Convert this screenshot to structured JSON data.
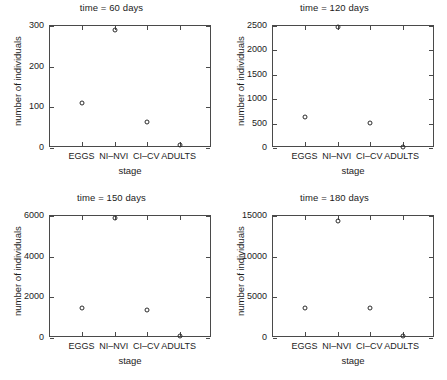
{
  "figure": {
    "background": "#ffffff",
    "marker_color": "#2b2b2b",
    "axis_color": "#4a4a4a",
    "stage_categories": [
      "EGGS",
      "NI–NVI",
      "CI–CV",
      "ADULTS"
    ],
    "xlabel": "stage",
    "ylabel": "number of individuals"
  },
  "chart_data": [
    {
      "type": "scatter",
      "title": "time = 60 days",
      "xlabel": "stage",
      "ylabel": "number of individuals",
      "categories": [
        "EGGS",
        "NI–NVI",
        "CI–CV",
        "ADULTS"
      ],
      "values": [
        110,
        290,
        65,
        8
      ],
      "ylim": [
        0,
        300
      ],
      "yticks": [
        0,
        100,
        200,
        300
      ],
      "ytick_labels": [
        "0",
        "100",
        "200",
        "300"
      ],
      "grid": false,
      "legend": null,
      "marker": "open-circle"
    },
    {
      "type": "scatter",
      "title": "time = 120 days",
      "xlabel": "stage",
      "ylabel": "number of individuals",
      "categories": [
        "EGGS",
        "NI–NVI",
        "CI–CV",
        "ADULTS"
      ],
      "values": [
        640,
        2480,
        510,
        30
      ],
      "ylim": [
        0,
        2500
      ],
      "yticks": [
        0,
        500,
        1000,
        1500,
        2000,
        2500
      ],
      "ytick_labels": [
        "0",
        "500",
        "1000",
        "1500",
        "2000",
        "2500"
      ],
      "grid": false,
      "legend": null,
      "marker": "open-circle"
    },
    {
      "type": "scatter",
      "title": "time = 150 days",
      "xlabel": "stage",
      "ylabel": "number of individuals",
      "categories": [
        "EGGS",
        "NI–NVI",
        "CI–CV",
        "ADULTS"
      ],
      "values": [
        1500,
        5900,
        1400,
        100
      ],
      "ylim": [
        0,
        6000
      ],
      "yticks": [
        0,
        2000,
        4000,
        6000
      ],
      "ytick_labels": [
        "0",
        "2000",
        "4000",
        "6000"
      ],
      "grid": false,
      "legend": null,
      "marker": "open-circle"
    },
    {
      "type": "scatter",
      "title": "time = 180 days",
      "xlabel": "stage",
      "ylabel": "number of individuals",
      "categories": [
        "EGGS",
        "NI–NVI",
        "CI–CV",
        "ADULTS"
      ],
      "values": [
        3700,
        14400,
        3700,
        200
      ],
      "ylim": [
        0,
        15000
      ],
      "yticks": [
        0,
        5000,
        10000,
        15000
      ],
      "ytick_labels": [
        "0",
        "5000",
        "10000",
        "15000"
      ],
      "grid": false,
      "legend": null,
      "marker": "open-circle"
    }
  ]
}
